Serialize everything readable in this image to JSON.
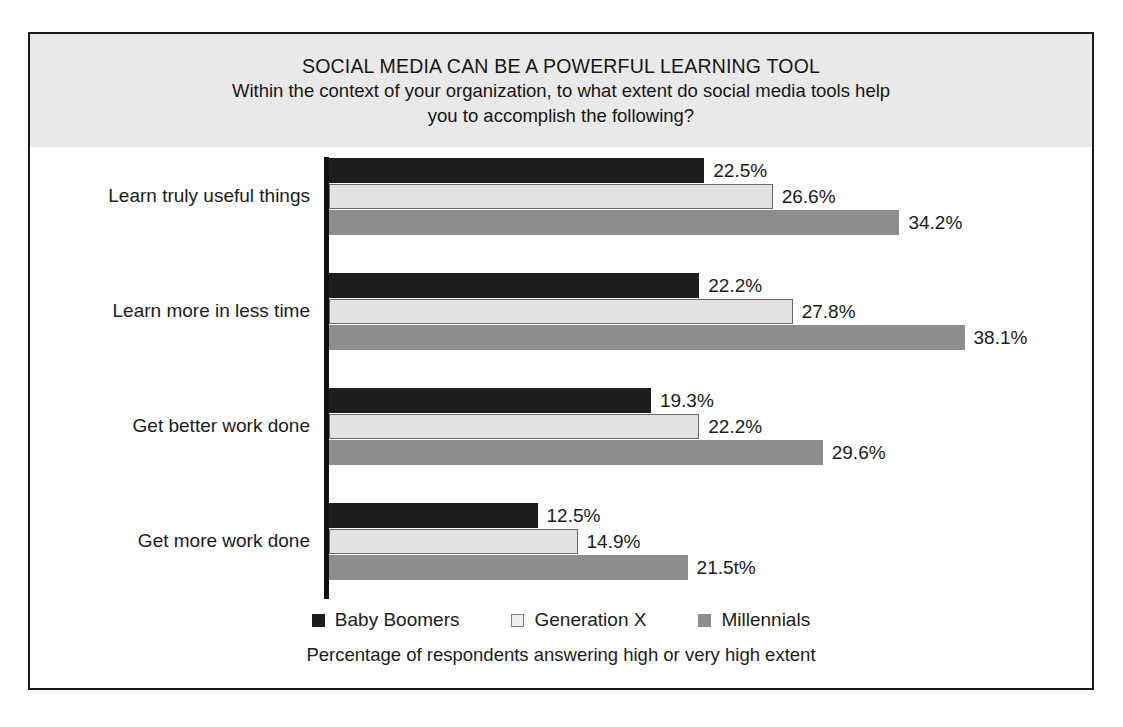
{
  "figure": {
    "title_main": "SOCIAL MEDIA CAN BE A POWERFUL LEARNING TOOL",
    "title_sub_line1": "Within the context of your organization, to what extent do social media tools help",
    "title_sub_line2": "you to accomplish the following?",
    "footer_caption": "Percentage of respondents answering high or very high extent"
  },
  "colors": {
    "baby_boomers": "#1d1d1d",
    "generation_x": "#e2e2e2",
    "millennials": "#8d8d8d",
    "frame": "#1b1b1b",
    "title_band": "#e9e9e9",
    "axis": "#111111"
  },
  "legend": {
    "position": "bottom",
    "items": [
      {
        "label": "Baby Boomers",
        "swatch": "legend-swatch-baby-boomers"
      },
      {
        "label": "Generation X",
        "swatch": "legend-swatch-generation-x"
      },
      {
        "label": "Millennials",
        "swatch": "legend-swatch-millennials"
      }
    ]
  },
  "chart_data": {
    "type": "bar",
    "orientation": "horizontal",
    "title": "SOCIAL MEDIA CAN BE A POWERFUL LEARNING TOOL",
    "subtitle": "Within the context of your organization, to what extent do social media tools help you to accomplish the following?",
    "xlabel": "Percentage of respondents answering high or very high extent",
    "ylabel": "",
    "grid": false,
    "axis_visible": "category-axis-only",
    "xlim": [
      0,
      38.1
    ],
    "units": "%",
    "categories": [
      "Learn truly useful things",
      "Learn more in less time",
      "Get better work done",
      "Get more work done"
    ],
    "series": [
      {
        "name": "Baby Boomers",
        "color": "#1d1d1d",
        "values": [
          22.5,
          22.2,
          19.3,
          12.5
        ],
        "labels": [
          "22.5%",
          "22.2%",
          "19.3%",
          "12.5%"
        ]
      },
      {
        "name": "Generation X",
        "color": "#e2e2e2",
        "values": [
          26.6,
          27.8,
          22.2,
          14.9
        ],
        "labels": [
          "26.6%",
          "27.8%",
          "22.2%",
          "14.9%"
        ]
      },
      {
        "name": "Millennials",
        "color": "#8d8d8d",
        "values": [
          34.2,
          38.1,
          29.6,
          21.5
        ],
        "labels": [
          "34.2%",
          "38.1%",
          "29.6%",
          "21.5t%"
        ]
      }
    ]
  }
}
